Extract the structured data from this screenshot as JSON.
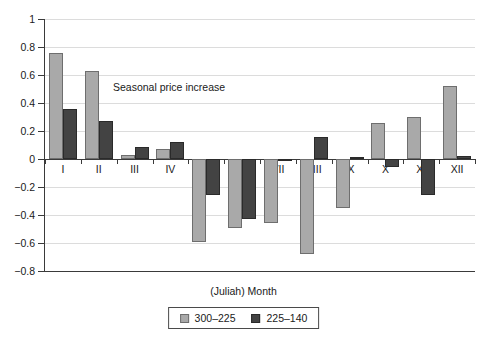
{
  "chart_data": {
    "type": "bar",
    "title": "",
    "annotation": "Seasonal price increase",
    "xlabel": "(Juliah) Month",
    "ylabel": "",
    "ylim": [
      -0.8,
      1
    ],
    "yticks": [
      1,
      0.8,
      0.6,
      0.4,
      0.2,
      0,
      -0.2,
      -0.4,
      -0.6,
      -0.8
    ],
    "ytick_labels": [
      "1",
      "0.8",
      "0.6",
      "0.4",
      "0.2",
      "0",
      "−0.2",
      "−0.4",
      "−0.6",
      "−0.8"
    ],
    "grid": true,
    "legend_position": "bottom",
    "categories": [
      "I",
      "II",
      "III",
      "IV",
      "V",
      "VI",
      "VII",
      "VIII",
      "IX",
      "X",
      "XI",
      "XII"
    ],
    "series": [
      {
        "name": "300–225",
        "color": "#a9a9a9",
        "values": [
          0.755,
          0.63,
          0.03,
          0.075,
          -0.59,
          -0.49,
          -0.46,
          -0.675,
          -0.35,
          0.26,
          0.3,
          0.525
        ]
      },
      {
        "name": "225–140",
        "color": "#434343",
        "values": [
          0.36,
          0.27,
          0.085,
          0.12,
          -0.26,
          -0.43,
          -0.015,
          0.16,
          0.015,
          -0.06,
          -0.26,
          0.025
        ]
      }
    ]
  }
}
